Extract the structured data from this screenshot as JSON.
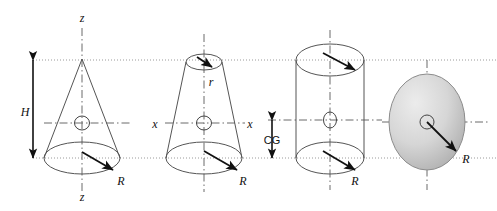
{
  "figure": {
    "background_color": "#ffffff",
    "line_color": "#555555",
    "guide_color": "#9a9a9a",
    "axis_color": "#6b6b6b",
    "arrow_color": "#111111",
    "disk_fill_light": "#e8e8e8",
    "disk_fill_dark": "#b8b8b8",
    "width": 497,
    "height": 211
  },
  "guides": {
    "top_y": 60,
    "bottom_y": 158,
    "mid_y": 123
  },
  "shapes": [
    {
      "id": "cone",
      "name": "solid-cone",
      "apex_x": 82,
      "apex_y": 59,
      "base_cx": 82,
      "base_cy": 158,
      "base_rx": 38,
      "base_ry": 16,
      "cg_x": 82,
      "cg_y": 123
    },
    {
      "id": "frustum",
      "name": "truncated-cone",
      "top_cx": 204,
      "top_cy": 62,
      "top_rx": 18,
      "top_ry": 8,
      "base_cx": 204,
      "base_cy": 158,
      "base_rx": 38,
      "base_ry": 16,
      "cg_x": 204,
      "cg_y": 123
    },
    {
      "id": "cylinder",
      "name": "cylinder",
      "cx": 330,
      "top_cy": 60,
      "bottom_cy": 158,
      "rx": 34,
      "ry": 16,
      "cg_x": 330,
      "cg_y": 123
    },
    {
      "id": "disk",
      "name": "shaded-disk",
      "cx": 427,
      "cy": 122,
      "rx": 38,
      "ry": 48
    }
  ],
  "labels": {
    "cone_axis_top": "z",
    "cone_axis_bottom": "z",
    "cone_height": "H",
    "cone_radius": "R",
    "frustum_top_radius": "r",
    "frustum_axis_left": "x",
    "frustum_axis_right": "x",
    "frustum_radius": "R",
    "cylinder_cg": "CG",
    "cylinder_radius": "R",
    "disk_radius": "R"
  },
  "label_positions": {
    "cone_axis_top": {
      "x": 82,
      "y": 22
    },
    "cone_axis_bottom": {
      "x": 82,
      "y": 199
    },
    "cone_height": {
      "x": 25,
      "y": 115
    },
    "cone_radius": {
      "x": 121,
      "y": 183
    },
    "frustum_top_radius": {
      "x": 210,
      "y": 82
    },
    "frustum_axis_left": {
      "x": 155,
      "y": 127
    },
    "frustum_axis_right": {
      "x": 249,
      "y": 127
    },
    "frustum_radius": {
      "x": 243,
      "y": 183
    },
    "cylinder_cg": {
      "x": 272,
      "y": 143
    },
    "cylinder_radius": {
      "x": 355,
      "y": 183
    },
    "disk_radius": {
      "x": 465,
      "y": 160
    }
  },
  "dimension_arrows": [
    {
      "id": "height-arrow",
      "name": "height-dimension-arrow",
      "label": "H",
      "x": 33,
      "y_top": 60,
      "y_bottom": 158
    },
    {
      "id": "cg-arrow",
      "name": "cg-dimension-arrow",
      "label": "CG",
      "x": 272,
      "y_top": 120,
      "y_bottom": 158
    }
  ],
  "radius_arrows": [
    {
      "id": "cone-R",
      "name": "cone-radius-arrow",
      "x1": 82,
      "y1": 152,
      "x2": 116,
      "y2": 172
    },
    {
      "id": "frustum-r",
      "name": "frustum-top-radius-arrow",
      "x1": 196,
      "y1": 57,
      "x2": 215,
      "y2": 68
    },
    {
      "id": "frustum-R",
      "name": "frustum-radius-arrow",
      "x1": 204,
      "y1": 151,
      "x2": 240,
      "y2": 172
    },
    {
      "id": "cylinder-top-R",
      "name": "cylinder-top-radius-arrow",
      "x1": 322,
      "y1": 53,
      "x2": 358,
      "y2": 72
    },
    {
      "id": "cylinder-bottom-R",
      "name": "cylinder-bottom-radius-arrow",
      "x1": 322,
      "y1": 151,
      "x2": 358,
      "y2": 172
    },
    {
      "id": "disk-R",
      "name": "disk-radius-arrow",
      "x1": 427,
      "y1": 122,
      "x2": 459,
      "y2": 154
    }
  ]
}
